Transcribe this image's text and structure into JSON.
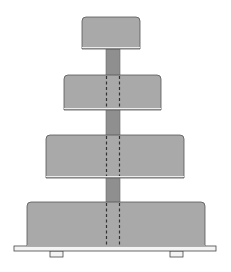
{
  "diagram": {
    "colors": {
      "background": "#ffffff",
      "tier_fill": "#a9a9a9",
      "tier_stroke": "#555555",
      "pillar_fill": "#8f8f8f",
      "base_fill": "#f4f4f4",
      "base_stroke": "#444444",
      "dash_color": "#333333"
    },
    "tiers": [
      {
        "x": 82,
        "y": 17,
        "w": 58,
        "h": 32
      },
      {
        "x": 64,
        "y": 75,
        "w": 97,
        "h": 35
      },
      {
        "x": 46,
        "y": 135,
        "w": 138,
        "h": 43
      },
      {
        "x": 27,
        "y": 202,
        "w": 178,
        "h": 45
      }
    ],
    "pillar": {
      "x": 106,
      "w": 14,
      "y": 49,
      "h": 197
    },
    "base_plate": {
      "x": 14,
      "y": 246,
      "w": 202,
      "h": 5
    },
    "feet": [
      {
        "x": 50,
        "y": 251,
        "w": 13,
        "h": 6
      },
      {
        "x": 170,
        "y": 251,
        "w": 13,
        "h": 6
      }
    ]
  }
}
